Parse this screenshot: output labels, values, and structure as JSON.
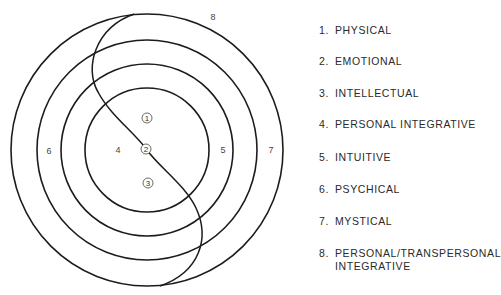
{
  "diagram": {
    "center": [
      147,
      150
    ],
    "rings": [
      {
        "radius": 62
      },
      {
        "radius": 86
      },
      {
        "radius": 110
      },
      {
        "radius": 136
      }
    ],
    "stroke_color": "#1c1c1c",
    "region_labels": [
      {
        "id": "4",
        "text": "4",
        "x": 118,
        "y": 153
      },
      {
        "id": "5",
        "text": "5",
        "x": 223,
        "y": 153
      },
      {
        "id": "6",
        "text": "6",
        "x": 49,
        "y": 154
      },
      {
        "id": "7",
        "text": "7",
        "x": 271,
        "y": 153
      },
      {
        "id": "8",
        "text": "8",
        "x": 213,
        "y": 20
      }
    ],
    "circled_labels": [
      {
        "id": "1",
        "text": "1",
        "x": 147,
        "y": 118
      },
      {
        "id": "2",
        "text": "2",
        "x": 146,
        "y": 149
      },
      {
        "id": "3",
        "text": "3",
        "x": 148,
        "y": 183
      }
    ]
  },
  "legend": {
    "items": [
      {
        "num": "1.",
        "label": "PHYSICAL"
      },
      {
        "num": "2.",
        "label": "EMOTIONAL"
      },
      {
        "num": "3.",
        "label": "INTELLECTUAL"
      },
      {
        "num": "4.",
        "label": "PERSONAL INTEGRATIVE"
      },
      {
        "num": "5.",
        "label": "INTUITIVE"
      },
      {
        "num": "6.",
        "label": "PSYCHICAL"
      },
      {
        "num": "7.",
        "label": "MYSTICAL"
      },
      {
        "num": "8.",
        "label": "PERSONAL/TRANSPERSONAL",
        "label_line2": "INTEGRATIVE"
      }
    ]
  }
}
